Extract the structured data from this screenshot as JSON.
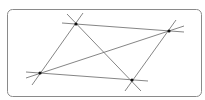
{
  "diagram": {
    "frame": {
      "x": 7,
      "y": 9,
      "width": 194,
      "height": 87,
      "rx": 5,
      "stroke": "#8a8a8a"
    },
    "line_color": "#777777",
    "point_color": "#111111",
    "points": [
      {
        "id": "A",
        "x": 76,
        "y": 24
      },
      {
        "id": "B",
        "x": 169,
        "y": 31
      },
      {
        "id": "C",
        "x": 40,
        "y": 73
      },
      {
        "id": "D",
        "x": 132,
        "y": 80
      }
    ],
    "lines": [
      {
        "from": "A",
        "to": "B",
        "x1": 62,
        "y1": 23,
        "x2": 184,
        "y2": 32
      },
      {
        "from": "C",
        "to": "D",
        "x1": 26,
        "y1": 72,
        "x2": 148,
        "y2": 81
      },
      {
        "from": "A",
        "to": "C",
        "x1": 83,
        "y1": 13,
        "x2": 32,
        "y2": 85
      },
      {
        "from": "B",
        "to": "D",
        "x1": 176,
        "y1": 20,
        "x2": 125,
        "y2": 91
      },
      {
        "from": "A",
        "to": "D",
        "x1": 67,
        "y1": 14,
        "x2": 141,
        "y2": 91
      },
      {
        "from": "C",
        "to": "B",
        "x1": 26,
        "y1": 78,
        "x2": 184,
        "y2": 26
      }
    ]
  }
}
